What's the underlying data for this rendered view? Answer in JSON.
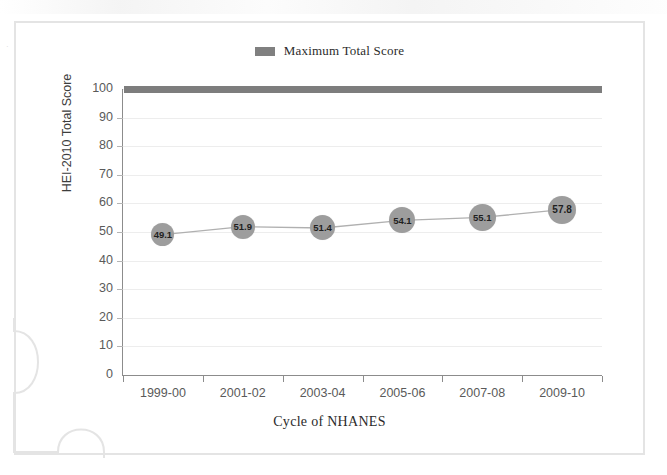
{
  "chart_data": {
    "type": "line",
    "title": "",
    "xlabel": "Cycle of NHANES",
    "ylabel": "HEI-2010 Total Score",
    "categories": [
      "1999-00",
      "2001-02",
      "2003-04",
      "2005-06",
      "2007-08",
      "2009-10"
    ],
    "series": [
      {
        "name": "HEI-2010 Total Score",
        "values": [
          49.1,
          51.9,
          51.4,
          54.1,
          55.1,
          57.8
        ],
        "labels": [
          "49.1",
          "51.9",
          "51.4",
          "54.1",
          "55.1",
          "57.8"
        ],
        "marker_color": "#9d9d9d",
        "line_color": "#b0b0b0"
      },
      {
        "name": "Maximum Total Score",
        "values": [
          100,
          100,
          100,
          100,
          100,
          100
        ],
        "color": "#7d7d7d",
        "style": "bar"
      }
    ],
    "ylim": [
      0,
      100
    ],
    "ytick_values": [
      0,
      10,
      20,
      30,
      40,
      50,
      60,
      70,
      80,
      90,
      100
    ],
    "ytick_labels": [
      "0",
      "10",
      "20",
      "30",
      "40",
      "50",
      "60",
      "70",
      "80",
      "90",
      "100"
    ],
    "grid": true,
    "grid_color": "#ededed",
    "legend": {
      "position": "top-center",
      "entries": [
        {
          "label": "Maximum Total Score",
          "color": "#7d7d7d",
          "swatch": "rectangle"
        }
      ]
    },
    "axis_color": "#8c8c8c",
    "background": "#ffffff"
  },
  "legend": {
    "label": "Maximum Total Score"
  },
  "axes": {
    "y_title": "HEI-2010 Total Score",
    "x_title": "Cycle of NHANES"
  },
  "artifacts": {
    "frame_color": "#e4e4e4",
    "speck": "·"
  }
}
